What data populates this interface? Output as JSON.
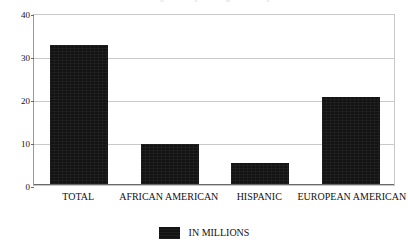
{
  "chart_data": {
    "type": "bar",
    "title": "",
    "xlabel": "",
    "ylabel": "",
    "categories": [
      "TOTAL",
      "AFRICAN AMERICAN",
      "HISPANIC",
      "EUROPEAN AMERICAN"
    ],
    "values": [
      32.3,
      9.3,
      5.0,
      20.3
    ],
    "series": [
      {
        "name": "IN MILLIONS",
        "values": [
          32.3,
          9.3,
          5.0,
          20.3
        ],
        "color": "#131313"
      }
    ],
    "ylim": [
      0,
      40
    ],
    "yticks": [
      0,
      10,
      20,
      30,
      40
    ],
    "ytick_labels": [
      "0",
      "10",
      "20",
      "30",
      "40"
    ],
    "grid": true,
    "grid_axis": "y",
    "legend": {
      "position": "bottom-center",
      "entries": [
        {
          "label": "IN MILLIONS",
          "color": "#131313"
        }
      ]
    }
  },
  "legend": {
    "swatch_name": "legend-color-swatch",
    "label": "IN MILLIONS"
  }
}
